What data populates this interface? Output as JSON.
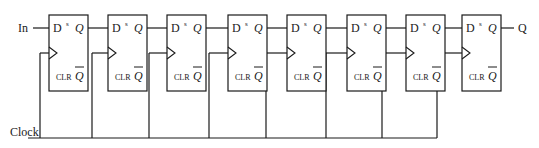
{
  "diagram": {
    "type": "shift-register",
    "input_label": "In",
    "output_label": "Q",
    "clock_label": "Clock",
    "stroke_color": "#1a1a1a",
    "flip_flops": [
      {
        "x": 49,
        "d": "D",
        "s": "s",
        "q": "Q",
        "clr": "CLR",
        "qbar": "Q"
      },
      {
        "x": 108,
        "d": "D",
        "s": "s",
        "q": "Q",
        "clr": "CLR",
        "qbar": "Q"
      },
      {
        "x": 167,
        "d": "D",
        "s": "s",
        "q": "Q",
        "clr": "CLR",
        "qbar": "Q"
      },
      {
        "x": 228,
        "d": "D",
        "s": "s",
        "q": "Q",
        "clr": "CLR",
        "qbar": "Q"
      },
      {
        "x": 287,
        "d": "D",
        "s": "s",
        "q": "Q",
        "clr": "CLR",
        "qbar": "Q"
      },
      {
        "x": 347,
        "d": "D",
        "s": "s",
        "q": "Q",
        "clr": "CLR",
        "qbar": "Q"
      },
      {
        "x": 406,
        "d": "D",
        "s": "s",
        "q": "Q",
        "clr": "CLR",
        "qbar": "Q"
      },
      {
        "x": 462,
        "d": "D",
        "s": "s",
        "q": "Q",
        "clr": "CLR",
        "qbar": "Q"
      }
    ],
    "clock_drops_x": [
      40,
      92,
      149,
      209,
      266,
      326,
      382,
      437
    ]
  }
}
